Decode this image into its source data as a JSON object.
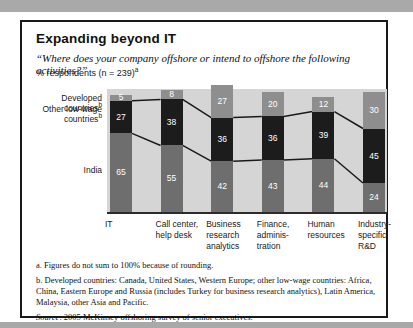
{
  "header": {
    "title": "Expanding beyond IT",
    "question": "“Where does your company offshore or intend to offshore the following activities?”",
    "respondents": "% respondents (n = 239)",
    "respondents_sup": "a"
  },
  "chart_data": {
    "type": "bar",
    "stacked": true,
    "unit": "% of respondents",
    "background": "#d5d5d5",
    "categories": [
      "IT",
      "Call center,\nhelp desk",
      "Business\nresearch\nanalytics",
      "Finance,\nadminis-\ntration",
      "Human\nresources",
      "Industry-\nspecific\nR&D"
    ],
    "series": [
      {
        "name": "India",
        "color": "#6e6e6e",
        "values": [
          65,
          55,
          42,
          43,
          44,
          24
        ]
      },
      {
        "name": "Other low-wage countries",
        "color": "#1c1c1c",
        "values": [
          27,
          38,
          36,
          36,
          39,
          45
        ]
      },
      {
        "name": "Developed countries",
        "color": "#8e8e8e",
        "values": [
          5,
          8,
          27,
          20,
          12,
          30
        ]
      }
    ],
    "left_labels": [
      {
        "text": "Developed countries",
        "sup": "b"
      },
      {
        "text": "Other low-wage\ncountries",
        "sup": "b"
      },
      {
        "text": "India",
        "sup": ""
      }
    ],
    "connector_line_color": "#1a1a1a",
    "legend_position": "left"
  },
  "footnotes": {
    "a": "a. Figures do not sum to 100% because of rounding.",
    "b": "b. Developed countries: Canada, United States, Western Europe; other low-wage countries: Africa, China, Eastern Europe and Russia (includes Turkey for business research analytics), Latin America, Malaysia, other Asia and Pacific.",
    "source_label": "Source",
    "source_text": ": 2005 McKinsey offshoring survey of senior executives."
  }
}
